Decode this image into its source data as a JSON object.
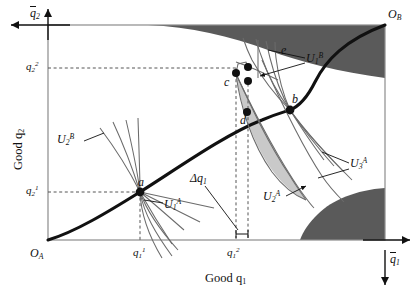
{
  "figure": {
    "type": "edgeworth-box-diagram",
    "title_visible": false,
    "background": "#ffffff"
  },
  "colors": {
    "ink": "#111111",
    "box_border": "#8c8c8c",
    "axis": "#8c8c8c",
    "dashed": "#555555",
    "contract_curve": "#111111",
    "indifference_curve": "#6b6b6b",
    "dark_region": "#5a5a5a",
    "light_region": "#c9c9c9",
    "point_fill": "#111111"
  },
  "axes": {
    "origin_A": "O",
    "origin_A_sub": "A",
    "origin_B": "O",
    "origin_B_sub": "B",
    "x_axis_label": "Good q",
    "x_axis_label_sub": "1",
    "y_axis_label": "Good q",
    "y_axis_label_sub": "2",
    "x_max_label": "q",
    "x_max_sub": "1",
    "y_max_label": "q",
    "y_max_sub": "2",
    "x_max_bar": true,
    "y_max_bar": true
  },
  "ticks": {
    "x": [
      {
        "id": "q1_1",
        "base": "q",
        "sub": "1",
        "sup": "1",
        "px": 140
      },
      {
        "id": "q1_2",
        "base": "q",
        "sub": "1",
        "sup": "2",
        "px": 232
      }
    ],
    "y": [
      {
        "id": "q2_2",
        "base": "q",
        "sub": "2",
        "sup": "2",
        "px": 68
      },
      {
        "id": "q2_1",
        "base": "q",
        "sub": "2",
        "sup": "1",
        "px": 192
      }
    ]
  },
  "points": [
    {
      "label": "a",
      "x": 140,
      "y": 192
    },
    {
      "label": "b",
      "x": 290,
      "y": 110
    },
    {
      "label": "c",
      "x": 236,
      "y": 73
    },
    {
      "label": "d",
      "x": 247,
      "y": 112
    },
    {
      "label": "e",
      "x": 248,
      "y": 67
    },
    {
      "label": "",
      "x": 248,
      "y": 81
    }
  ],
  "curve_labels": [
    {
      "id": "U2B",
      "base": "U",
      "sub": "2",
      "sup": "B",
      "x": 60,
      "y": 140
    },
    {
      "id": "U1A",
      "base": "U",
      "sub": "1",
      "sup": "A",
      "x": 166,
      "y": 205
    },
    {
      "id": "U1B",
      "base": "U",
      "sub": "1",
      "sup": "B",
      "x": 308,
      "y": 60
    },
    {
      "id": "U3A",
      "base": "U",
      "sub": "3",
      "sup": "A",
      "x": 352,
      "y": 164
    },
    {
      "id": "U2A",
      "base": "U",
      "sub": "2",
      "sup": "A",
      "x": 265,
      "y": 198
    }
  ],
  "annotations": [
    {
      "id": "delta_q1",
      "text": "Δq",
      "sub": "1",
      "x": 196,
      "y": 178
    }
  ],
  "regions": [
    {
      "id": "dark-top",
      "shade": "dark",
      "description": "upper shaded region near top edge"
    },
    {
      "id": "dark-bottom-right",
      "shade": "dark",
      "description": "lower-right shaded region"
    },
    {
      "id": "lens",
      "shade": "light",
      "description": "lens shaped gains-from-trade region between c, d and b"
    }
  ]
}
